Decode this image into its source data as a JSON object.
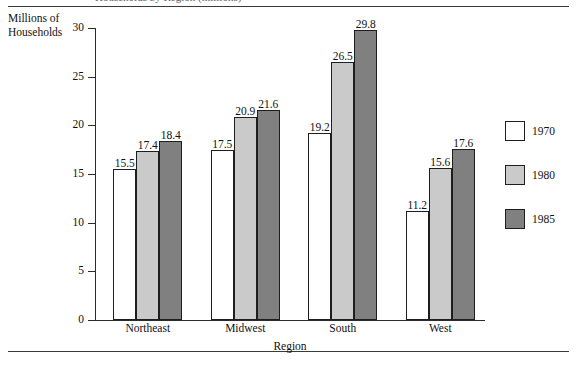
{
  "figure": {
    "top_rule": "rule",
    "bottom_rule": "rule",
    "clipped_caption": "Households by Region (millions)"
  },
  "chart_data": {
    "type": "bar",
    "title": "",
    "categories": [
      "Northeast",
      "Midwest",
      "South",
      "West"
    ],
    "series": [
      {
        "name": "1970",
        "values": [
          15.5,
          17.5,
          19.2,
          11.2
        ],
        "color": "#ffffff"
      },
      {
        "name": "1980",
        "values": [
          17.4,
          20.9,
          26.5,
          15.6
        ],
        "color": "#cacaca"
      },
      {
        "name": "1985",
        "values": [
          18.4,
          21.6,
          29.8,
          17.6
        ],
        "color": "#808080"
      }
    ],
    "xlabel": "Region",
    "ylabel": "Millions of\nHouseholds",
    "ylabel_line1": "Millions of",
    "ylabel_line2": "Households",
    "ylim": [
      0,
      30
    ],
    "yticks": [
      0,
      5,
      10,
      15,
      20,
      25,
      30
    ],
    "ytick_labels": [
      "0",
      "5",
      "10",
      "15",
      "20",
      "25",
      "30"
    ],
    "grid": false,
    "legend_position": "right",
    "bar_border_color": "#1e1e1e"
  },
  "legend": {
    "entries": [
      {
        "label": "1970",
        "color": "#ffffff"
      },
      {
        "label": "1980",
        "color": "#cacaca"
      },
      {
        "label": "1985",
        "color": "#808080"
      }
    ]
  }
}
